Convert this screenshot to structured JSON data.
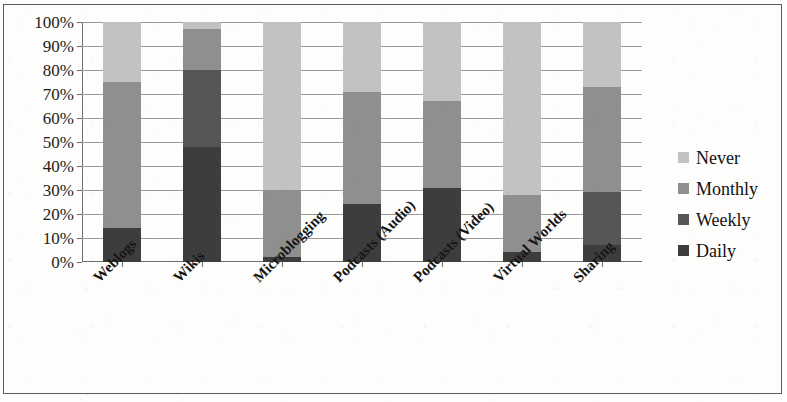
{
  "chart_data": {
    "type": "bar",
    "subtype": "stacked-100-percent",
    "title": "",
    "xlabel": "",
    "ylabel": "",
    "ylim": [
      0,
      100
    ],
    "ytick_labels": [
      "100%",
      "90%",
      "80%",
      "70%",
      "60%",
      "50%",
      "40%",
      "30%",
      "20%",
      "10%",
      "0%"
    ],
    "ytick_values": [
      100,
      90,
      80,
      70,
      60,
      50,
      40,
      30,
      20,
      10,
      0
    ],
    "grid": true,
    "legend_position": "right",
    "categories": [
      "Weblogs",
      "Wikis",
      "Microblogging",
      "Podcasts (Audio)",
      "Podcasts (Video)",
      "Virtual Worlds",
      "Sharing"
    ],
    "series": [
      {
        "name": "Daily",
        "color": "#3d3d3d",
        "values": [
          14,
          48,
          2,
          24,
          31,
          4,
          7
        ]
      },
      {
        "name": "Weekly",
        "color": "#565656",
        "values": [
          0,
          32,
          0,
          0,
          0,
          0,
          22
        ]
      },
      {
        "name": "Monthly",
        "color": "#8f8f8f",
        "values": [
          61,
          17,
          28,
          47,
          36,
          24,
          44
        ]
      },
      {
        "name": "Never",
        "color": "#c2c2c2",
        "values": [
          25,
          3,
          70,
          29,
          33,
          72,
          27
        ]
      }
    ],
    "legend_order_top_to_bottom": [
      "Never",
      "Monthly",
      "Weekly",
      "Daily"
    ]
  },
  "legend": {
    "items": [
      {
        "label": "Never",
        "color": "#c2c2c2"
      },
      {
        "label": "Monthly",
        "color": "#8f8f8f"
      },
      {
        "label": "Weekly",
        "color": "#565656"
      },
      {
        "label": "Daily",
        "color": "#3d3d3d"
      }
    ]
  },
  "colors": {
    "axis": "#6e6e6e",
    "gridline": "#9a9a9a",
    "text": "#161616",
    "background": "#fdfdfb",
    "border": "#5c5c5c"
  }
}
